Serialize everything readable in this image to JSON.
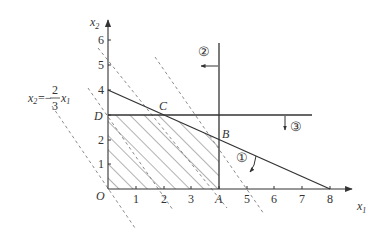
{
  "diagram": {
    "axes": {
      "x_label": "x",
      "x_label_sub": "1",
      "y_label": "x",
      "y_label_sub": "2",
      "origin_label": "O",
      "x_ticks": [
        "1",
        "2",
        "3",
        "4",
        "5",
        "6",
        "7",
        "8"
      ],
      "y_ticks": [
        "1",
        "2",
        "4",
        "5",
        "6"
      ]
    },
    "points": {
      "A": "A",
      "B": "B",
      "C": "C",
      "D": "D"
    },
    "constraints": [
      {
        "id": "1",
        "marker": "①",
        "description": "line from (0,4) to (8,0)"
      },
      {
        "id": "2",
        "marker": "②",
        "description": "vertical line x1 = 4, feasible side left"
      },
      {
        "id": "3",
        "marker": "③",
        "description": "horizontal line x2 = 3, feasible side below"
      }
    ],
    "objective_line": {
      "label_lhs": "x",
      "label_lhs_sub": "2",
      "label_eq": "=−",
      "label_frac_num": "2",
      "label_frac_den": "3",
      "label_rhs": "x",
      "label_rhs_sub": "1"
    },
    "feasible_region": [
      "O",
      "A",
      "B",
      "C",
      "D"
    ],
    "colors": {
      "line": "#333333",
      "dashed": "#888888",
      "hatch": "#555555"
    }
  }
}
